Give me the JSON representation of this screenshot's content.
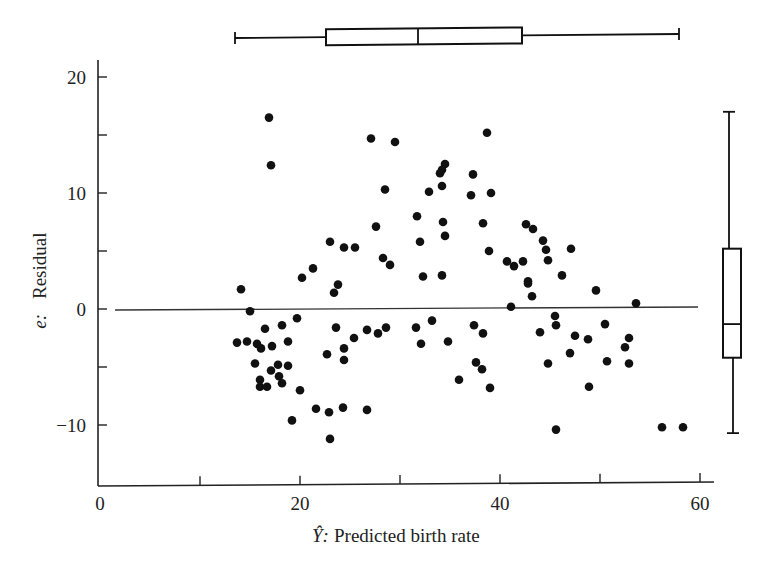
{
  "chart_data": {
    "type": "scatter",
    "title": "",
    "xlabel": "Ŷ:  Predicted birth rate",
    "xlabel_symbol": "Ŷ:",
    "xlabel_text": "Predicted birth rate",
    "ylabel": "e:  Residual",
    "ylabel_symbol": "e:",
    "ylabel_text": "Residual",
    "xlim": [
      0,
      61
    ],
    "ylim": [
      -15,
      22
    ],
    "x_ticks": [
      0,
      10,
      20,
      30,
      40,
      50,
      60
    ],
    "x_tick_labels": [
      "0",
      "",
      "20",
      "",
      "40",
      "",
      "60"
    ],
    "y_ticks": [
      -15,
      -10,
      -5,
      0,
      5,
      10,
      15,
      20
    ],
    "y_tick_labels": {
      "-10": "−10",
      "0": "0",
      "10": "10",
      "20": "20"
    },
    "grid": false,
    "reference_line": {
      "y": 0,
      "x_from": 1.5,
      "x_to": 59.8
    },
    "points": [
      [
        16.9,
        16.5
      ],
      [
        17.1,
        12.4
      ],
      [
        27.1,
        14.7
      ],
      [
        29.5,
        14.4
      ],
      [
        28.5,
        10.3
      ],
      [
        27.6,
        7.1
      ],
      [
        23.0,
        5.8
      ],
      [
        24.4,
        5.3
      ],
      [
        25.5,
        5.3
      ],
      [
        28.3,
        4.4
      ],
      [
        29.0,
        3.8
      ],
      [
        21.3,
        3.5
      ],
      [
        20.2,
        2.7
      ],
      [
        23.8,
        2.1
      ],
      [
        23.4,
        1.4
      ],
      [
        14.1,
        1.7
      ],
      [
        15.0,
        -0.2
      ],
      [
        16.5,
        -1.7
      ],
      [
        18.2,
        -1.4
      ],
      [
        19.7,
        -0.8
      ],
      [
        23.6,
        -1.6
      ],
      [
        26.7,
        -1.8
      ],
      [
        27.8,
        -2.1
      ],
      [
        28.6,
        -1.6
      ],
      [
        25.4,
        -2.5
      ],
      [
        13.7,
        -2.9
      ],
      [
        14.7,
        -2.8
      ],
      [
        15.7,
        -3.0
      ],
      [
        16.1,
        -3.4
      ],
      [
        17.2,
        -3.2
      ],
      [
        18.8,
        -2.8
      ],
      [
        22.7,
        -3.9
      ],
      [
        24.4,
        -3.4
      ],
      [
        24.4,
        -4.4
      ],
      [
        15.5,
        -4.7
      ],
      [
        17.1,
        -5.3
      ],
      [
        17.8,
        -4.8
      ],
      [
        18.8,
        -4.9
      ],
      [
        16.0,
        -6.1
      ],
      [
        17.9,
        -5.8
      ],
      [
        18.2,
        -6.4
      ],
      [
        16.0,
        -6.7
      ],
      [
        16.7,
        -6.7
      ],
      [
        20.0,
        -7.0
      ],
      [
        21.6,
        -8.6
      ],
      [
        22.9,
        -8.9
      ],
      [
        24.3,
        -8.5
      ],
      [
        26.7,
        -8.7
      ],
      [
        19.2,
        -9.6
      ],
      [
        23.0,
        -11.2
      ],
      [
        38.7,
        15.2
      ],
      [
        34.5,
        12.5
      ],
      [
        34.2,
        12.0
      ],
      [
        34.0,
        11.7
      ],
      [
        37.3,
        11.6
      ],
      [
        32.9,
        10.1
      ],
      [
        34.2,
        10.6
      ],
      [
        37.1,
        9.8
      ],
      [
        39.1,
        10.0
      ],
      [
        31.7,
        8.0
      ],
      [
        34.3,
        7.5
      ],
      [
        34.5,
        6.3
      ],
      [
        38.3,
        7.4
      ],
      [
        32.0,
        5.8
      ],
      [
        38.9,
        5.0
      ],
      [
        42.6,
        7.3
      ],
      [
        43.3,
        6.9
      ],
      [
        44.3,
        5.9
      ],
      [
        42.3,
        4.1
      ],
      [
        44.8,
        4.2
      ],
      [
        32.3,
        2.8
      ],
      [
        34.2,
        2.9
      ],
      [
        40.7,
        4.1
      ],
      [
        41.4,
        3.7
      ],
      [
        42.8,
        2.4
      ],
      [
        44.6,
        5.1
      ],
      [
        47.1,
        5.2
      ],
      [
        46.2,
        2.9
      ],
      [
        42.8,
        2.2
      ],
      [
        43.2,
        1.1
      ],
      [
        41.1,
        0.2
      ],
      [
        49.6,
        1.6
      ],
      [
        53.6,
        0.5
      ],
      [
        31.6,
        -1.6
      ],
      [
        32.1,
        -3.0
      ],
      [
        33.2,
        -1.0
      ],
      [
        37.4,
        -1.4
      ],
      [
        38.3,
        -2.1
      ],
      [
        34.8,
        -2.8
      ],
      [
        37.6,
        -4.6
      ],
      [
        38.2,
        -5.2
      ],
      [
        35.9,
        -6.1
      ],
      [
        39.0,
        -6.8
      ],
      [
        45.5,
        -0.6
      ],
      [
        45.6,
        -1.4
      ],
      [
        44.0,
        -2.0
      ],
      [
        50.5,
        -1.3
      ],
      [
        47.5,
        -2.3
      ],
      [
        48.8,
        -2.6
      ],
      [
        52.9,
        -2.5
      ],
      [
        52.5,
        -3.3
      ],
      [
        47.0,
        -3.8
      ],
      [
        50.7,
        -4.5
      ],
      [
        52.9,
        -4.7
      ],
      [
        44.8,
        -4.7
      ],
      [
        48.9,
        -6.7
      ],
      [
        45.6,
        -10.4
      ],
      [
        56.2,
        -10.2
      ],
      [
        58.3,
        -10.2
      ]
    ],
    "x_boxplot": {
      "orientation": "horizontal",
      "position": "top",
      "whisker_low": 13.5,
      "q1": 22.6,
      "median": 31.8,
      "q3": 42.2,
      "whisker_high": 57.9
    },
    "y_boxplot": {
      "orientation": "vertical",
      "position": "right",
      "whisker_low": -10.7,
      "q1": -4.2,
      "median": -1.3,
      "q3": 5.2,
      "whisker_high": 17.0
    }
  },
  "colors": {
    "ink": "#111111",
    "axis": "#222222",
    "background": "#ffffff"
  }
}
